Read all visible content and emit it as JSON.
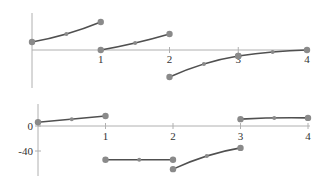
{
  "chart_data": [
    {
      "type": "line",
      "title": "",
      "xlabel": "",
      "ylabel": "",
      "xlim": [
        0,
        4
      ],
      "x_ticks": [
        "1",
        "2",
        "3",
        "4"
      ],
      "y_ticks": [],
      "grid": false,
      "legend": null,
      "note": "Piecewise function, y values in relative units (no y tick labels shown); zero on x-axis",
      "series": [
        {
          "name": "segment-1",
          "x": [
            0,
            0.5,
            1
          ],
          "values": [
            8,
            16,
            28
          ]
        },
        {
          "name": "segment-2",
          "x": [
            1,
            1.5,
            2
          ],
          "values": [
            0,
            7,
            16
          ]
        },
        {
          "name": "segment-3",
          "x": [
            2,
            2.5,
            3
          ],
          "values": [
            -27,
            -14,
            -6
          ]
        },
        {
          "name": "segment-4",
          "x": [
            3,
            3.5,
            4
          ],
          "values": [
            -6,
            -2,
            0
          ]
        }
      ],
      "ylim": [
        -37,
        37
      ]
    },
    {
      "type": "line",
      "title": "",
      "xlabel": "",
      "ylabel": "",
      "xlim": [
        0,
        4
      ],
      "x_ticks": [
        "1",
        "2",
        "3",
        "4"
      ],
      "y_ticks": [
        "0",
        "-40"
      ],
      "grid": false,
      "legend": null,
      "series": [
        {
          "name": "segment-1",
          "x": [
            0,
            0.5,
            1
          ],
          "values": [
            6,
            11,
            16
          ]
        },
        {
          "name": "segment-2",
          "x": [
            1,
            1.5,
            2
          ],
          "values": [
            -54,
            -54,
            -54
          ]
        },
        {
          "name": "segment-3",
          "x": [
            2,
            2.5,
            3
          ],
          "values": [
            -69,
            -48,
            -35
          ]
        },
        {
          "name": "segment-4",
          "x": [
            3,
            3.5,
            4
          ],
          "values": [
            11,
            13,
            13
          ]
        }
      ],
      "ylim": [
        -78,
        35
      ]
    }
  ],
  "labels": {
    "top_x": [
      "1",
      "2",
      "3",
      "4"
    ],
    "bottom_x": [
      "1",
      "2",
      "3",
      "4"
    ],
    "bottom_y": [
      "0",
      "-40"
    ]
  }
}
